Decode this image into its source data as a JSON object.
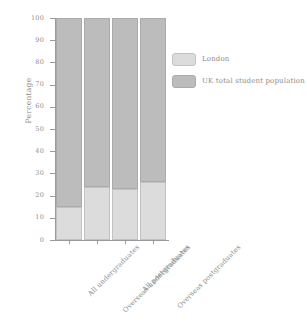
{
  "chart_data": {
    "type": "bar",
    "stacked": true,
    "stack_mode": "percent",
    "title": "",
    "subtitle": "",
    "xlabel": "",
    "ylabel": "Percentage",
    "ylim": [
      0,
      100
    ],
    "yticks": [
      0,
      10,
      20,
      30,
      40,
      50,
      60,
      70,
      80,
      90,
      100
    ],
    "ytick_labels": [
      "0",
      "10",
      "20",
      "30",
      "40",
      "50",
      "60",
      "70",
      "80",
      "90",
      "100"
    ],
    "grid": false,
    "legend_position": "right",
    "categories": [
      "All undergraduates",
      "Overseas undergraduates",
      "All postgraduates",
      "Overseas postgraduates"
    ],
    "series": [
      {
        "name": "London",
        "color": "#dcdcdc",
        "values": [
          15,
          24,
          23,
          26
        ]
      },
      {
        "name": "UK total student population",
        "color": "#bcbcbc",
        "values": [
          85,
          76,
          77,
          74
        ]
      }
    ]
  },
  "legend": {
    "items": [
      {
        "label": "London",
        "color": "#dcdcdc"
      },
      {
        "label": "UK total student population",
        "color": "#bcbcbc"
      }
    ]
  },
  "axes": {
    "y_title": "Percentage"
  }
}
